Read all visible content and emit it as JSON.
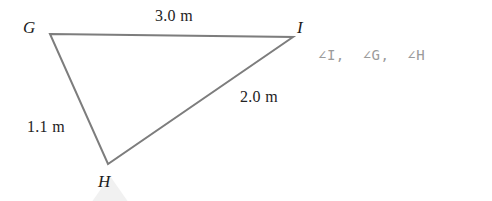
{
  "figure": {
    "type": "triangle-diagram",
    "background_color": "#ffffff",
    "stroke_color": "#7d7d7d",
    "stroke_width": 2,
    "vertices": [
      {
        "name": "G",
        "label": "G",
        "x": 50,
        "y": 34
      },
      {
        "name": "I",
        "label": "I",
        "x": 293,
        "y": 37
      },
      {
        "name": "H",
        "label": "H",
        "x": 108,
        "y": 164
      }
    ],
    "sides": [
      {
        "name": "GI",
        "label": "3.0 m",
        "value": 3.0,
        "unit": "m"
      },
      {
        "name": "IH",
        "label": "2.0 m",
        "value": 2.0,
        "unit": "m"
      },
      {
        "name": "GH",
        "label": "1.1 m",
        "value": 1.1,
        "unit": "m"
      }
    ]
  },
  "answer": {
    "text": "∠I,  ∠G,  ∠H",
    "color": "#9b9b9b"
  },
  "watermark": {
    "color": "#f1f1f1"
  }
}
